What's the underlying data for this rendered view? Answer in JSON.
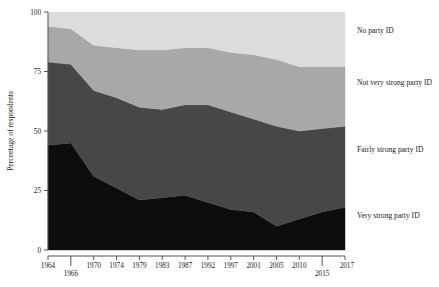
{
  "chart_data": {
    "type": "area",
    "stacked": true,
    "title": "",
    "xlabel": "",
    "ylabel": "Percentage of respondents",
    "ylim": [
      0,
      100
    ],
    "yticks": [
      0,
      25,
      50,
      75,
      100
    ],
    "ytick_labels": [
      "0",
      "25",
      "50",
      "75",
      "100"
    ],
    "grid": false,
    "legend_position": "right-inline",
    "x": [
      1964,
      1966,
      1970,
      1974,
      1979,
      1983,
      1987,
      1992,
      1997,
      2001,
      2005,
      2010,
      2015,
      2017
    ],
    "xtick_labels": [
      "1964",
      "1966",
      "1970",
      "1974",
      "1979",
      "1983",
      "1987",
      "1992",
      "1997",
      "2001",
      "2005",
      "2010",
      "2015",
      "2017"
    ],
    "xtick_rows": [
      0,
      1,
      0,
      0,
      0,
      0,
      0,
      0,
      0,
      0,
      0,
      0,
      1,
      0
    ],
    "series": [
      {
        "name": "Very strong party ID",
        "color": "#0d0d0d",
        "values": [
          44,
          45,
          31,
          26,
          21,
          22,
          23,
          20,
          17,
          16,
          10,
          13,
          16,
          18
        ]
      },
      {
        "name": "Fairly strong party ID",
        "color": "#474747",
        "values": [
          35,
          33,
          36,
          38,
          39,
          37,
          38,
          41,
          41,
          39,
          42,
          37,
          35,
          34
        ]
      },
      {
        "name": "Not very strong party ID",
        "color": "#a8a8a8",
        "values": [
          15,
          15,
          19,
          21,
          24,
          25,
          24,
          24,
          25,
          27,
          28,
          27,
          26,
          25
        ]
      },
      {
        "name": "No party ID",
        "color": "#dcdcdc",
        "values": [
          6,
          7,
          14,
          15,
          16,
          16,
          15,
          15,
          17,
          18,
          20,
          23,
          23,
          23
        ]
      }
    ],
    "cumulative_tops": {
      "very_strong": [
        44,
        45,
        31,
        26,
        21,
        22,
        23,
        20,
        17,
        16,
        10,
        13,
        16,
        18
      ],
      "fairly_strong": [
        79,
        78,
        67,
        64,
        60,
        59,
        61,
        61,
        58,
        55,
        52,
        50,
        51,
        52
      ],
      "not_very_strong": [
        94,
        93,
        86,
        85,
        84,
        84,
        85,
        85,
        83,
        82,
        80,
        77,
        77,
        77
      ],
      "no_party": [
        100,
        100,
        100,
        100,
        100,
        100,
        100,
        100,
        100,
        100,
        100,
        100,
        100,
        100
      ]
    },
    "legend_labels": [
      "No party ID",
      "Not very strong party ID",
      "Fairly strong party ID",
      "Very strong party ID"
    ]
  }
}
